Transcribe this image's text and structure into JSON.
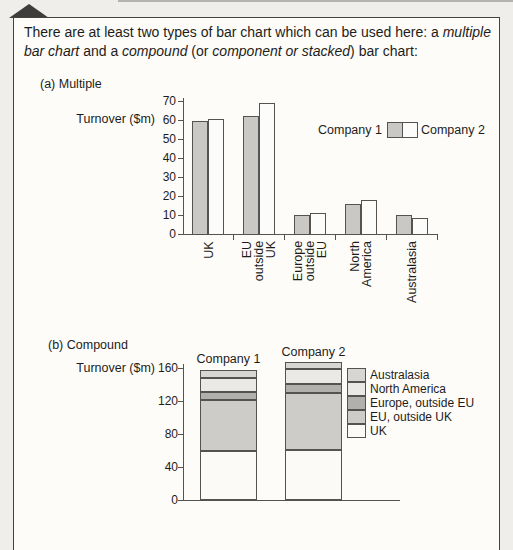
{
  "intro": {
    "segments": [
      {
        "text": "There are at least two types of bar chart which can be used here: a ",
        "italic": false
      },
      {
        "text": "multiple bar chart",
        "italic": true
      },
      {
        "text": " and a ",
        "italic": false
      },
      {
        "text": "compound",
        "italic": true
      },
      {
        "text": " (or ",
        "italic": false
      },
      {
        "text": "component or stacked",
        "italic": true
      },
      {
        "text": ") bar chart:",
        "italic": false
      }
    ]
  },
  "colors": {
    "axis": "#55534f",
    "box_border": "#454341",
    "page_background": "#f0eeea",
    "panel_background": "#fdfcf9",
    "company1_fill": "#c9c8c4",
    "company2_fill": "#fcfcfa"
  },
  "chart_data": [
    {
      "type": "bar",
      "caption": "(a) Multiple",
      "ylabel": "Turnover ($m)",
      "ylim": [
        0,
        70
      ],
      "ytick_step": 10,
      "grid": false,
      "legend_position": "right-middle",
      "categories": [
        "UK",
        "EU outside UK",
        "Europe outside EU",
        "North America",
        "Australasia"
      ],
      "category_label_lines": [
        [
          "UK"
        ],
        [
          "EU",
          "outside",
          "UK"
        ],
        [
          "Europe",
          "outside",
          "EU"
        ],
        [
          "North",
          "America"
        ],
        [
          "Australasia"
        ]
      ],
      "series": [
        {
          "name": "Company 1",
          "color": "#c9c8c4",
          "values": [
            59.5,
            62,
            10,
            16,
            10
          ]
        },
        {
          "name": "Company 2",
          "color": "#fcfcfa",
          "values": [
            60.5,
            69,
            11,
            18,
            8.5
          ]
        }
      ]
    },
    {
      "type": "stacked-bar",
      "caption": "(b) Compound",
      "ylabel": "Turnover ($m)",
      "ylim": [
        0,
        160
      ],
      "yticks": [
        0,
        40,
        80,
        120,
        160
      ],
      "grid": false,
      "legend_position": "right",
      "categories": [
        "Company 1",
        "Company 2"
      ],
      "segments_bottom_to_top": [
        {
          "name": "UK",
          "color": "#fbfaf7",
          "values": [
            59.5,
            60.5
          ]
        },
        {
          "name": "EU, outside UK",
          "color": "#cdccc8",
          "values": [
            62,
            69
          ]
        },
        {
          "name": "Europe, outside EU",
          "color": "#b1b0ac",
          "values": [
            10,
            11
          ]
        },
        {
          "name": "North America",
          "color": "#ebe9e6",
          "values": [
            16,
            18
          ]
        },
        {
          "name": "Australasia",
          "color": "#d7d6d2",
          "values": [
            10,
            8.5
          ]
        }
      ],
      "legend_order_top_to_bottom": [
        "Australasia",
        "North America",
        "Europe, outside EU",
        "EU, outside UK",
        "UK"
      ],
      "totals": [
        157.5,
        167
      ]
    }
  ]
}
